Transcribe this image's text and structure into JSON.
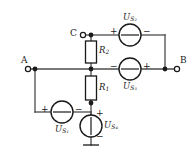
{
  "diagram": {
    "type": "electrical-circuit-schematic",
    "line_color": "#4d4d4d",
    "ink_color": "#1a1a1a"
  },
  "terminals": [
    {
      "id": "A",
      "label": "A",
      "x": 27,
      "y": 69,
      "marker": "open-circle"
    },
    {
      "id": "B",
      "label": "B",
      "x": 178,
      "y": 69,
      "marker": "open-circle"
    },
    {
      "id": "C",
      "label": "C",
      "x": 82,
      "y": 35,
      "marker": "open-circle"
    }
  ],
  "resistors": [
    {
      "id": "R2",
      "label": "R",
      "sub": "2",
      "orientation": "vertical",
      "x": 91,
      "y1": 41,
      "y2": 63
    },
    {
      "id": "R1",
      "label": "R",
      "sub": "1",
      "orientation": "vertical",
      "x": 91,
      "y1": 76,
      "y2": 100
    }
  ],
  "sources": [
    {
      "id": "US2",
      "label": "U",
      "sub": "S₂",
      "subscript_text": "S2",
      "orientation": "horizontal",
      "cx": 130,
      "cy": 35,
      "r": 11,
      "plus": "+",
      "minus": "−",
      "plus_side": "left",
      "minus_side": "right",
      "label_pos": "above"
    },
    {
      "id": "US3",
      "label": "U",
      "sub": "S₃",
      "subscript_text": "S3",
      "orientation": "horizontal",
      "cx": 130,
      "cy": 69,
      "r": 11,
      "plus": "+",
      "minus": "−",
      "plus_side": "right",
      "minus_side": "left",
      "label_pos": "below"
    },
    {
      "id": "US1",
      "label": "U",
      "sub": "S₁",
      "subscript_text": "S1",
      "orientation": "horizontal",
      "cx": 62,
      "cy": 112,
      "r": 11,
      "plus": "+",
      "minus": "−",
      "plus_side": "left",
      "minus_side": "right",
      "label_pos": "below"
    },
    {
      "id": "US4",
      "label": "U",
      "sub": "S₄",
      "subscript_text": "S4",
      "orientation": "vertical",
      "cx": 91,
      "cy": 126,
      "r": 11,
      "plus": "+",
      "minus": "−",
      "plus_side": "top",
      "minus_side": "bottom",
      "label_pos": "right"
    }
  ],
  "nodes": [
    {
      "id": "n-left",
      "x": 35,
      "y": 69
    },
    {
      "id": "n-center",
      "x": 91,
      "y": 69
    },
    {
      "id": "n-c",
      "x": 91,
      "y": 35
    },
    {
      "id": "n-right",
      "x": 165,
      "y": 69
    },
    {
      "id": "n-r1-bottom",
      "x": 91,
      "y": 103
    }
  ],
  "ground": {
    "id": "gnd",
    "x": 91,
    "y": 145,
    "label": "ground"
  }
}
